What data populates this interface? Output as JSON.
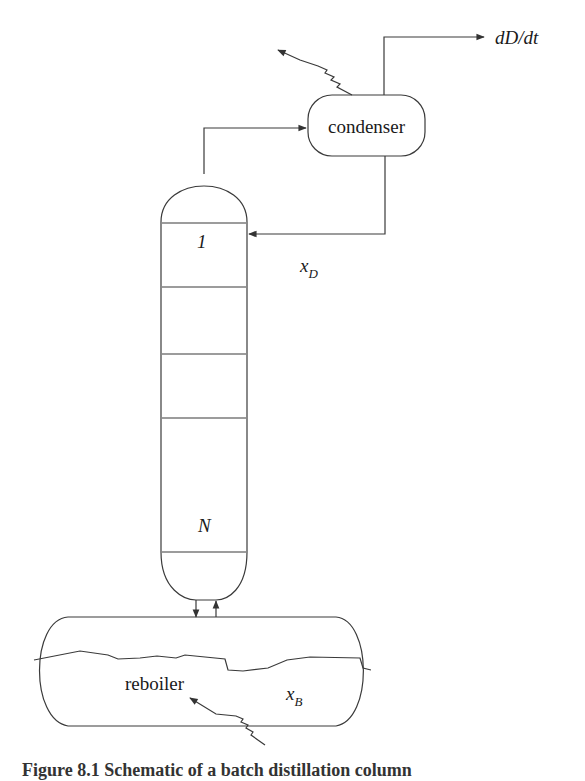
{
  "diagram": {
    "type": "batch distillation column schematic",
    "units": {
      "condenser": {
        "label": "condenser"
      },
      "column": {
        "top_tray_label": "1",
        "bottom_tray_label": "N",
        "tray_line_y": [
          223,
          287,
          354,
          418,
          552
        ]
      },
      "reboiler": {
        "label": "reboiler"
      }
    },
    "streams": {
      "distillate_rate": {
        "label": "dD/dt"
      },
      "distillate_composition": {
        "symbol": "x",
        "subscript": "D"
      },
      "bottoms_composition": {
        "symbol": "x",
        "subscript": "B"
      }
    },
    "colors": {
      "line": "#3a3a3a",
      "text": "#1a1a1a",
      "background": "#ffffff"
    }
  },
  "caption": {
    "text": "Figure 8.1   Schematic of a batch distillation column"
  }
}
